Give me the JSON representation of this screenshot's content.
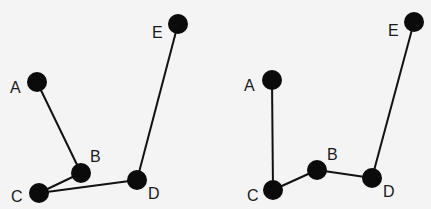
{
  "diagrams": [
    {
      "id": "left",
      "nodes": [
        {
          "name": "A",
          "x": 37,
          "y": 82,
          "lx": 10,
          "ly": 93
        },
        {
          "name": "B",
          "x": 81,
          "y": 173,
          "lx": 90,
          "ly": 162
        },
        {
          "name": "C",
          "x": 39,
          "y": 193,
          "lx": 11,
          "ly": 202
        },
        {
          "name": "D",
          "x": 137,
          "y": 180,
          "lx": 148,
          "ly": 199
        },
        {
          "name": "E",
          "x": 178,
          "y": 24,
          "lx": 152,
          "ly": 38
        }
      ],
      "edges": [
        [
          "A",
          "B"
        ],
        [
          "B",
          "C"
        ],
        [
          "C",
          "D"
        ],
        [
          "D",
          "E"
        ]
      ]
    },
    {
      "id": "right",
      "nodes": [
        {
          "name": "A",
          "x": 272,
          "y": 80,
          "lx": 244,
          "ly": 91
        },
        {
          "name": "B",
          "x": 317,
          "y": 170,
          "lx": 327,
          "ly": 160
        },
        {
          "name": "C",
          "x": 273,
          "y": 190,
          "lx": 247,
          "ly": 201
        },
        {
          "name": "D",
          "x": 372,
          "y": 178,
          "lx": 383,
          "ly": 197
        },
        {
          "name": "E",
          "x": 414,
          "y": 22,
          "lx": 388,
          "ly": 36
        }
      ],
      "edges": [
        [
          "A",
          "C"
        ],
        [
          "C",
          "B"
        ],
        [
          "B",
          "D"
        ],
        [
          "D",
          "E"
        ]
      ]
    }
  ],
  "style": {
    "node_radius": 10,
    "node_color": "#0b0b0b",
    "edge_color": "#111111",
    "background": "#f4f4f4"
  }
}
